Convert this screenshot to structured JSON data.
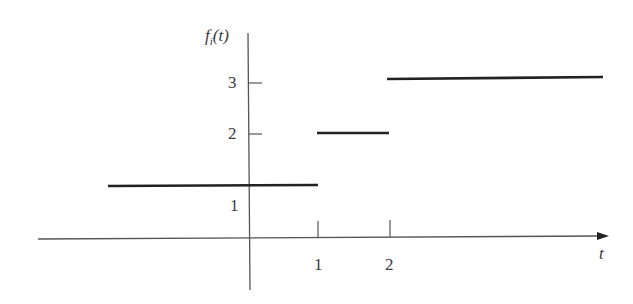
{
  "figure": {
    "y_axis_label_f": "f",
    "y_axis_label_sub": "i",
    "y_axis_label_arg": "(t)",
    "x_axis_label": "t",
    "x_ticks": [
      {
        "label": "1",
        "value": 1
      },
      {
        "label": "2",
        "value": 2
      }
    ],
    "y_ticks": [
      {
        "label": "1",
        "value": 1
      },
      {
        "label": "2",
        "value": 2
      },
      {
        "label": "3",
        "value": 3
      }
    ],
    "segments": [
      {
        "from": "-inf",
        "to": 1,
        "value": 1.3
      },
      {
        "from": 1,
        "to": 2,
        "value": 2
      },
      {
        "from": 2,
        "to": "+inf",
        "value": 3
      }
    ],
    "line_color": "#222222",
    "axis_color": "#555555"
  }
}
